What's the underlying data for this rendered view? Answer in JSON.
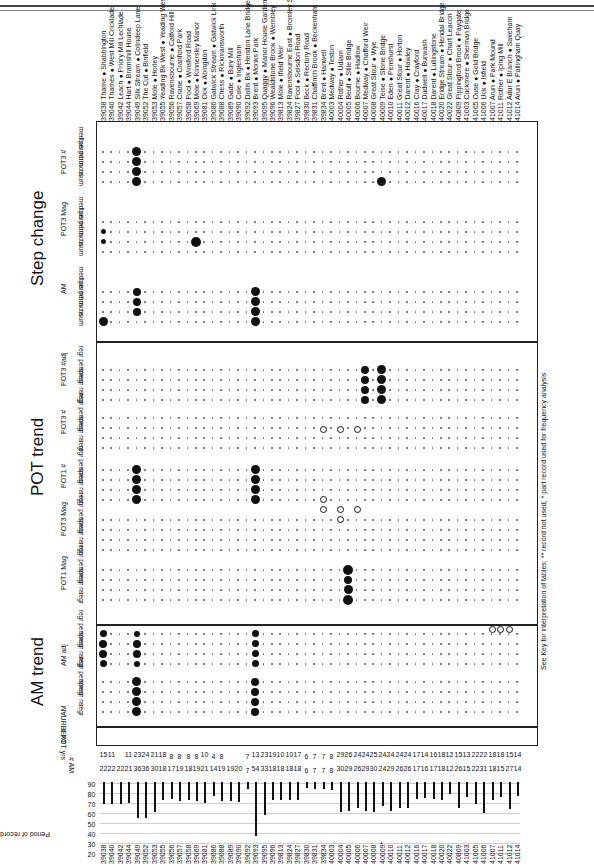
{
  "sections": {
    "am_trend": "AM trend",
    "pot_trend": "POT trend",
    "step_change": "Step change"
  },
  "subsections": {
    "am": "AM",
    "am_adj": "AM adj",
    "pot1_mag": "POT1 Mag",
    "pot3_mag": "POT3 Mag",
    "pot1_num": "POT1 #",
    "pot3_num": "POT3 #",
    "pot3_num_adj": "POT3 #adj",
    "step_am": "AM",
    "step_pot3_mag": "POT3 Mag",
    "step_pot3_num": "POT3 #"
  },
  "trend_columns": [
    "regr",
    "regr ns",
    "spear",
    "regr perm"
  ],
  "step_columns": [
    "cusum",
    "bus ns",
    "bus perm",
    "med perm"
  ],
  "row_labels": {
    "urbext": "URBEXT",
    "pot_yrs": "# POT yrs",
    "am_n": "# AM",
    "period": "Period of record"
  },
  "period_axis_ticks": [
    "90",
    "80",
    "70",
    "60",
    "50",
    "40",
    "30",
    "20"
  ],
  "footnote": "See Key for interpretation of tables; ** record not used, * part record used for frequency analysis",
  "stations": [
    {
      "id": "39038",
      "name": "Thame ● Shabbington",
      "pot_yrs": "15",
      "am": "22"
    },
    {
      "id": "39040",
      "name": "Thames ● West Mill Cricklade",
      "pot_yrs": "11",
      "am": "22"
    },
    {
      "id": "39042",
      "name": "Leach ● Priory Mill Lechlade",
      "pot_yrs": "",
      "am": "22"
    },
    {
      "id": "39044",
      "name": "Hart ● Bramshill House",
      "pot_yrs": "11",
      "am": "21"
    },
    {
      "id": "39049",
      "name": "Silk Stream ● Colindeep Lane",
      "pot_yrs": "23",
      "am": "36"
    },
    {
      "id": "39052",
      "name": "The Cut ● Binfield",
      "pot_yrs": "24",
      "am": "36"
    },
    {
      "id": "39053",
      "name": "Mole ● Horley",
      "pot_yrs": "21",
      "am": "30"
    },
    {
      "id": "39055",
      "name": "Yeading Bk West ● Yeading West",
      "pot_yrs": "18",
      "am": "18"
    },
    {
      "id": "39056",
      "name": "Ravensbourne ● Catford Hill",
      "pot_yrs": "8",
      "am": "17"
    },
    {
      "id": "39057",
      "name": "Crane ● Cranford Park",
      "pot_yrs": "8",
      "am": "19"
    },
    {
      "id": "39058",
      "name": "Pool ● Winsford Road",
      "pot_yrs": "8",
      "am": "18"
    },
    {
      "id": "39069",
      "name": "Mole ● Kinnersley Manor",
      "pot_yrs": "8",
      "am": "19"
    },
    {
      "id": "39081",
      "name": "Ock ● Abingdon",
      "pot_yrs": "10",
      "am": "21"
    },
    {
      "id": "39086",
      "name": "Gatwick Stream ● Gatwick Link",
      "pot_yrs": "4",
      "am": "14"
    },
    {
      "id": "39088",
      "name": "Chess ● Rickmansworth",
      "pot_yrs": "8",
      "am": "19"
    },
    {
      "id": "39089",
      "name": "Gade ● Bury Mill",
      "pot_yrs": "",
      "am": "19"
    },
    {
      "id": "39090",
      "name": "Cole ● Inglesham",
      "pot_yrs": "",
      "am": "20"
    },
    {
      "id": "39092",
      "name": "Dollis Bk ● Hendon Lane Bridge",
      "pot_yrs": "7",
      "am": "7"
    },
    {
      "id": "39093",
      "name": "Brent ● Monks Park",
      "pot_yrs": "13",
      "am": "54"
    },
    {
      "id": "39095",
      "name": "Quaggy ● Manor House Gardens",
      "pot_yrs": "23",
      "am": "33"
    },
    {
      "id": "39096",
      "name": "Wealdstone Brook ● Wembley",
      "pot_yrs": "19",
      "am": "18"
    },
    {
      "id": "39813",
      "name": "Mole ● Ifield Weir",
      "pot_yrs": "10",
      "am": "18"
    },
    {
      "id": "39824",
      "name": "Ravensbourne East ● Bromley South",
      "pot_yrs": "10",
      "am": "18"
    },
    {
      "id": "39827",
      "name": "Pool ● Selsdon Road",
      "pot_yrs": "17",
      "am": "18"
    },
    {
      "id": "39830",
      "name": "Beck ● Rectory Road",
      "pot_yrs": "6",
      "am": "6"
    },
    {
      "id": "39831",
      "name": "Chaffinch Brook ● Beckenham",
      "pot_yrs": "7",
      "am": "7"
    },
    {
      "id": "39834",
      "name": "Brent ● Hanwell",
      "pot_yrs": "7",
      "am": "7"
    },
    {
      "id": "40003",
      "name": "Medway ● Teston",
      "pot_yrs": "8",
      "am": "8"
    },
    {
      "id": "40004",
      "name": "Rother ● Udiam",
      "pot_yrs": "29",
      "am": "30"
    },
    {
      "id": "40005",
      "name": "Beult ● Stile Bridge",
      "pot_yrs": "26",
      "am": "29"
    },
    {
      "id": "40006",
      "name": "Bourne ● Hadlow",
      "pot_yrs": "24",
      "am": "26"
    },
    {
      "id": "40007",
      "name": "Medway ● Chafford Weir",
      "pot_yrs": "24",
      "am": "29"
    },
    {
      "id": "40008",
      "name": "Great Stour ● Wye",
      "pot_yrs": "25",
      "am": "30"
    },
    {
      "id": "40009",
      "name": "Teise ● Stone Bridge",
      "pot_yrs": "24",
      "am": "24"
    },
    {
      "id": "40010",
      "name": "Eden ● Penshurst",
      "pot_yrs": "24",
      "am": "29"
    },
    {
      "id": "40011",
      "name": "Great Stour ● Horton",
      "pot_yrs": "24",
      "am": "26"
    },
    {
      "id": "40012",
      "name": "Darent ● Hawley",
      "pot_yrs": "24",
      "am": "26"
    },
    {
      "id": "40016",
      "name": "Cray ● Crayford",
      "pot_yrs": "17",
      "am": "17"
    },
    {
      "id": "40017",
      "name": "Dudwell ● Burwash",
      "pot_yrs": "14",
      "am": "16"
    },
    {
      "id": "40018",
      "name": "Darent ● Lullingstone",
      "pot_yrs": "16",
      "am": "17"
    },
    {
      "id": "40020",
      "name": "Eridge Stream ● Hendal Bridge",
      "pot_yrs": "18",
      "am": "18"
    },
    {
      "id": "40022",
      "name": "Great Stour ● Chart Leacon",
      "pot_yrs": "12",
      "am": "12"
    },
    {
      "id": "40809",
      "name": "Pippingford Brook ● Paygate",
      "pot_yrs": "15",
      "am": "26"
    },
    {
      "id": "41003",
      "name": "Cuckmere ● Sherman Bridge",
      "pot_yrs": "13",
      "am": "15"
    },
    {
      "id": "41005",
      "name": "Ouse ● Gold Bridge",
      "pot_yrs": "22",
      "am": "22"
    },
    {
      "id": "41006",
      "name": "Uck ● Isfield",
      "pot_yrs": "22",
      "am": "31"
    },
    {
      "id": "41007",
      "name": "Arun ● Park Mound",
      "pot_yrs": "18",
      "am": "18"
    },
    {
      "id": "41011",
      "name": "Rother ● Iping Mill",
      "pot_yrs": "18",
      "am": "15"
    },
    {
      "id": "41012",
      "name": "Adur E Branch ● Sakeham",
      "pot_yrs": "15",
      "am": "27"
    },
    {
      "id": "41014",
      "name": "Arun ● Pallingham Quay",
      "pot_yrs": "14",
      "am": "14"
    }
  ],
  "bottom_ids": [
    "39038",
    "39040",
    "39042",
    "39044",
    "39049",
    "39052",
    "39053",
    "39055",
    "39056",
    "39057",
    "39058",
    "39069",
    "39081",
    "39086",
    "39088",
    "39089",
    "39090",
    "39092",
    "39093",
    "39095",
    "39096",
    "39813",
    "39824",
    "39827",
    "39830",
    "39831",
    "39834",
    "40003",
    "40004",
    "40005",
    "40006",
    "40007",
    "40008",
    "40009*",
    "40010",
    "40011",
    "40012",
    "40016",
    "40017",
    "40018",
    "40020",
    "40022",
    "40809",
    "41003",
    "41005",
    "41006",
    "41007",
    "41011",
    "41012",
    "41014"
  ]
}
